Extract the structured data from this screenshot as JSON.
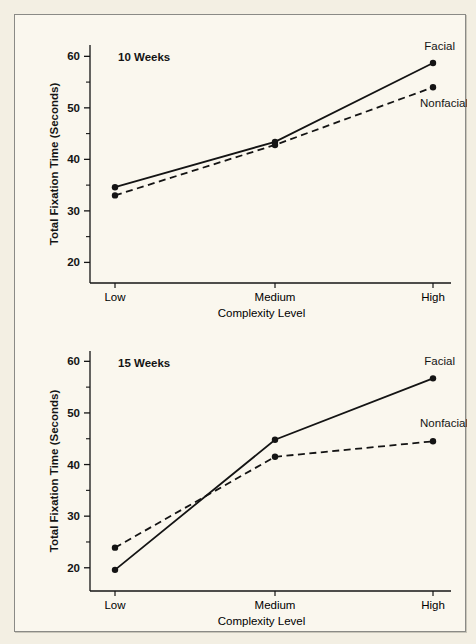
{
  "figure": {
    "background_color": "#f3efe3",
    "panel_color": "#faf7ee",
    "frame_color": "#8a8a86",
    "ink_color": "#141414"
  },
  "panels": [
    {
      "id": "10weeks",
      "title": "10 Weeks",
      "ylabel": "Total Fixation Time (Seconds)",
      "xlabel": "Complexity Level",
      "categories": [
        "Low",
        "Medium",
        "High"
      ],
      "yticks": [
        20,
        30,
        40,
        50,
        60
      ],
      "ytick_labels": [
        "20",
        "30",
        "40",
        "50",
        "60"
      ],
      "yminor": [
        25,
        35,
        45,
        55
      ],
      "series": [
        {
          "name": "Facial",
          "label": "Facial",
          "style": "solid",
          "values": [
            34.6,
            43.4,
            58.7
          ]
        },
        {
          "name": "Nonfacial",
          "label": "Nonfacial",
          "style": "dashed",
          "values": [
            33.0,
            42.8,
            54.0
          ]
        }
      ]
    },
    {
      "id": "15weeks",
      "title": "15 Weeks",
      "ylabel": "Total Fixation Time (Seconds)",
      "xlabel": "Complexity Level",
      "categories": [
        "Low",
        "Medium",
        "High"
      ],
      "yticks": [
        20,
        30,
        40,
        50,
        60
      ],
      "ytick_labels": [
        "20",
        "30",
        "40",
        "50",
        "60"
      ],
      "yminor": [
        25,
        35,
        45,
        55
      ],
      "series": [
        {
          "name": "Facial",
          "label": "Facial",
          "style": "solid",
          "values": [
            19.6,
            44.8,
            56.7
          ]
        },
        {
          "name": "Nonfacial",
          "label": "Nonfacial",
          "style": "dashed",
          "values": [
            23.9,
            41.5,
            44.5
          ]
        }
      ]
    }
  ],
  "chart_data": [
    {
      "type": "line",
      "title": "10 Weeks",
      "xlabel": "Complexity Level",
      "ylabel": "Total Fixation Time (Seconds)",
      "categories": [
        "Low",
        "Medium",
        "High"
      ],
      "series": [
        {
          "name": "Facial",
          "values": [
            34.6,
            43.4,
            58.7
          ]
        },
        {
          "name": "Nonfacial",
          "values": [
            33.0,
            42.8,
            54.0
          ]
        }
      ],
      "ylim": [
        16,
        62
      ],
      "yticks": [
        20,
        30,
        40,
        50,
        60
      ],
      "grid": false,
      "legend": "inline-right-labels"
    },
    {
      "type": "line",
      "title": "15 Weeks",
      "xlabel": "Complexity Level",
      "ylabel": "Total Fixation Time (Seconds)",
      "categories": [
        "Low",
        "Medium",
        "High"
      ],
      "series": [
        {
          "name": "Facial",
          "values": [
            19.6,
            44.8,
            56.7
          ]
        },
        {
          "name": "Nonfacial",
          "values": [
            23.9,
            41.5,
            44.5
          ]
        }
      ],
      "ylim": [
        16,
        62
      ],
      "yticks": [
        20,
        30,
        40,
        50,
        60
      ],
      "grid": false,
      "legend": "inline-right-labels"
    }
  ]
}
